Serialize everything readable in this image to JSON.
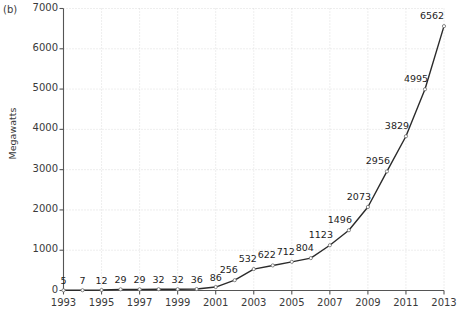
{
  "panel": {
    "label": "(b)"
  },
  "chart_data": {
    "type": "line",
    "title": "",
    "xlabel": "",
    "ylabel": "Megawatts",
    "x": [
      1993,
      1994,
      1995,
      1996,
      1997,
      1998,
      1999,
      2000,
      2001,
      2002,
      2003,
      2004,
      2005,
      2006,
      2007,
      2008,
      2009,
      2010,
      2011,
      2012,
      2013
    ],
    "values": [
      5,
      7,
      12,
      29,
      29,
      32,
      32,
      36,
      86,
      256,
      532,
      622,
      712,
      804,
      1123,
      1496,
      2073,
      2956,
      3829,
      4995,
      6562
    ],
    "point_labels": [
      "5",
      "7",
      "12",
      "29",
      "29",
      "32",
      "32",
      "36",
      "86",
      "256",
      "532",
      "622",
      "712",
      "804",
      "1123",
      "1496",
      "2073",
      "2956",
      "3829",
      "4995",
      "6562"
    ],
    "xlim": [
      1993,
      2013
    ],
    "ylim": [
      0,
      7000
    ],
    "yticks": [
      0,
      1000,
      2000,
      3000,
      4000,
      5000,
      6000,
      7000
    ],
    "ytick_labels": [
      "0",
      "1000",
      "2000",
      "3000",
      "4000",
      "5000",
      "6000",
      "7000"
    ],
    "xticks": [
      1993,
      1995,
      1997,
      1999,
      2001,
      2003,
      2005,
      2007,
      2009,
      2011,
      2013
    ],
    "xtick_labels": [
      "1993",
      "1995",
      "1997",
      "1999",
      "2001",
      "2003",
      "2005",
      "2007",
      "2009",
      "2011",
      "2013"
    ],
    "grid": true,
    "legend": null,
    "colors": {
      "line": "#2b2b2b",
      "grid": "#cfcfcf",
      "axis": "#555555",
      "text": "#3a3a3a",
      "background": "#ffffff"
    }
  }
}
